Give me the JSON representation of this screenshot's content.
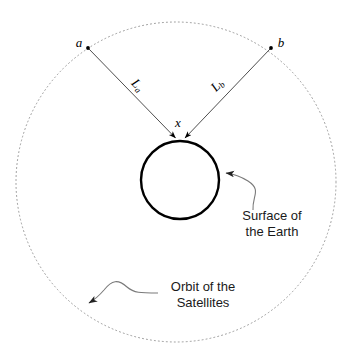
{
  "figure": {
    "background_color": "#ffffff",
    "line_color": "#000000",
    "orbit_color": "#9a9a9a",
    "annotation_color": "#7a7a7a",
    "text_color": "#1a1a1a"
  },
  "points": {
    "satellite_a": {
      "label": "a",
      "x": 87,
      "y": 47
    },
    "satellite_b": {
      "label": "b",
      "x": 272,
      "y": 47
    },
    "receiver": {
      "label": "x",
      "x": 180,
      "y": 141
    }
  },
  "distances": {
    "from_a": {
      "label": "L",
      "subscript": "a"
    },
    "from_b": {
      "label": "L",
      "subscript": "b"
    }
  },
  "annotations": {
    "earth_surface": {
      "line1": "Surface of",
      "line2": "the Earth"
    },
    "orbit": {
      "line1": "Orbit of the",
      "line2": "Satellites"
    }
  },
  "shapes": {
    "earth": {
      "center_x": 180,
      "center_y": 180,
      "radius": 39,
      "stroke_width": 2.4
    },
    "orbit": {
      "center_x": 176,
      "center_y": 182,
      "radius": 160,
      "stroke_width": 1,
      "dash": "1 3"
    }
  }
}
